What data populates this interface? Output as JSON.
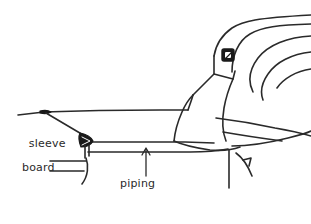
{
  "figure": {
    "kind": "line-drawing",
    "width": 311,
    "height": 224,
    "background_color": "#ffffff",
    "ink_color": "#2a2a2a",
    "fill_color": "#1a1a1a"
  },
  "labels": {
    "sleeve_board": {
      "line1": "sleeve",
      "line2": "board"
    },
    "piping": "piping"
  },
  "annotations": {
    "piping_leader": "arrow-up",
    "piping_leader_target": "lower-seam-line"
  },
  "parts": {
    "thimble": "thimble-on-thumb",
    "board_tip": "pointed-board-end",
    "hand": "fist-with-fingers",
    "fabric": "sleeve-fabric-folds"
  }
}
